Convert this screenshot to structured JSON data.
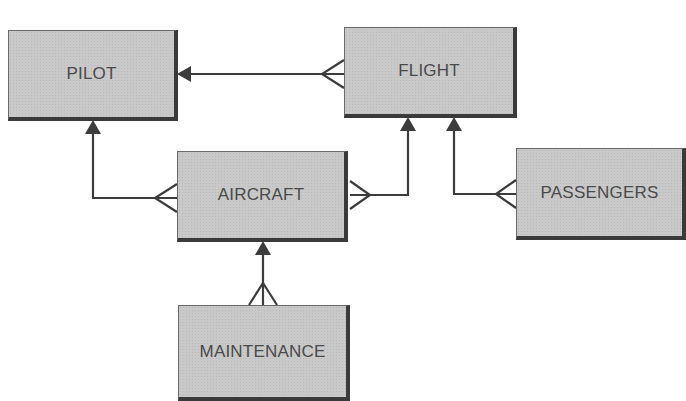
{
  "diagram": {
    "type": "entity-relationship",
    "notation": "crow's foot",
    "entities": [
      {
        "id": "pilot",
        "label": "PILOT"
      },
      {
        "id": "flight",
        "label": "FLIGHT"
      },
      {
        "id": "aircraft",
        "label": "AIRCRAFT"
      },
      {
        "id": "passengers",
        "label": "PASSENGERS"
      },
      {
        "id": "maintenance",
        "label": "MAINTENANCE"
      }
    ],
    "relationships": [
      {
        "from": "flight",
        "to": "pilot",
        "from_cardinality": "many",
        "to_cardinality": "one"
      },
      {
        "from": "aircraft",
        "to": "pilot",
        "from_cardinality": "many",
        "to_cardinality": "one"
      },
      {
        "from": "aircraft",
        "to": "flight",
        "from_cardinality": "many",
        "to_cardinality": "one"
      },
      {
        "from": "passengers",
        "to": "flight",
        "from_cardinality": "many",
        "to_cardinality": "one"
      },
      {
        "from": "maintenance",
        "to": "aircraft",
        "from_cardinality": "many",
        "to_cardinality": "one"
      }
    ]
  },
  "colors": {
    "box_fill": "#c9c9c9",
    "box_shadow": "#3a3a3a",
    "line": "#3c3c3c",
    "text": "#4a4a4a"
  }
}
